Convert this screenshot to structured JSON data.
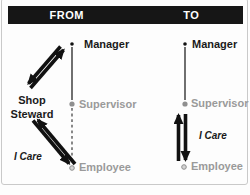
{
  "header": {
    "from": "FROM",
    "to": "TO"
  },
  "from_column": {
    "manager": "Manager",
    "supervisor": "Supervisor",
    "employee": "Employee",
    "steward_line1": "Shop",
    "steward_line2": "Steward",
    "care": "I Care"
  },
  "to_column": {
    "manager": "Manager",
    "supervisor": "Supervisor",
    "employee": "Employee",
    "care": "I Care"
  },
  "icons": {
    "manager_bullet": "small-black-dot",
    "supervisor_bullet": "gray-filled-dot",
    "employee_bullet": "gray-open-dot",
    "from_upper_connector": "thick-two-way-diagonal-arrows",
    "from_lower_connector": "thick-two-way-diagonal-arrows",
    "to_connector": "thick-two-way-vertical-arrows"
  },
  "colors": {
    "header_bg": "#161616",
    "header_text": "#ffffff",
    "text_dark": "#1a1a1a",
    "text_gray": "#9a9a9a",
    "arrow": "#111111",
    "line": "#333333",
    "frame": "#c9c9c9"
  }
}
